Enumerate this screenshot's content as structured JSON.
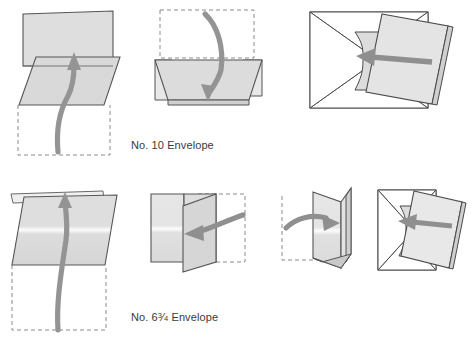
{
  "figure": {
    "background_color": "#ffffff"
  },
  "palette": {
    "outline": "#555555",
    "outline_dark": "#3f3f3f",
    "fill_light": "#f4f4f4",
    "fill_mid": "#dedede",
    "fill_shade": "#d2d2d2",
    "fill_white": "#ffffff",
    "arrow": "#8f8f8f",
    "arrow_dark": "#7d7d7d",
    "dashed": "#8a8a8a",
    "text": "#3a3a3a"
  },
  "rows": [
    {
      "id": "row-no10",
      "caption": "No. 10 Envelope",
      "caption_prefix": "No. 10 Envelope",
      "steps": [
        {
          "id": "no10-step-1",
          "name": "fold-up-bottom-third",
          "arrow": "up-curved"
        },
        {
          "id": "no10-step-2",
          "name": "fold-down-top-third",
          "arrow": "down-curved"
        },
        {
          "id": "no10-step-3",
          "name": "insert-into-envelope",
          "arrow": "left-straight"
        }
      ]
    },
    {
      "id": "row-no6",
      "caption": "No. 6¾ Envelope",
      "caption_prefix": "No. 6",
      "caption_fraction_numerator": "3",
      "caption_fraction_denominator": "4",
      "caption_suffix": "Envelope",
      "steps": [
        {
          "id": "no6-step-1",
          "name": "fold-in-half-up",
          "arrow": "up-curved"
        },
        {
          "id": "no6-step-2",
          "name": "fold-right-panel-left",
          "arrow": "left-curved"
        },
        {
          "id": "no6-step-3",
          "name": "fold-left-panel-right",
          "arrow": "right-curved"
        },
        {
          "id": "no6-step-4",
          "name": "insert-into-envelope",
          "arrow": "left-straight"
        }
      ]
    }
  ]
}
